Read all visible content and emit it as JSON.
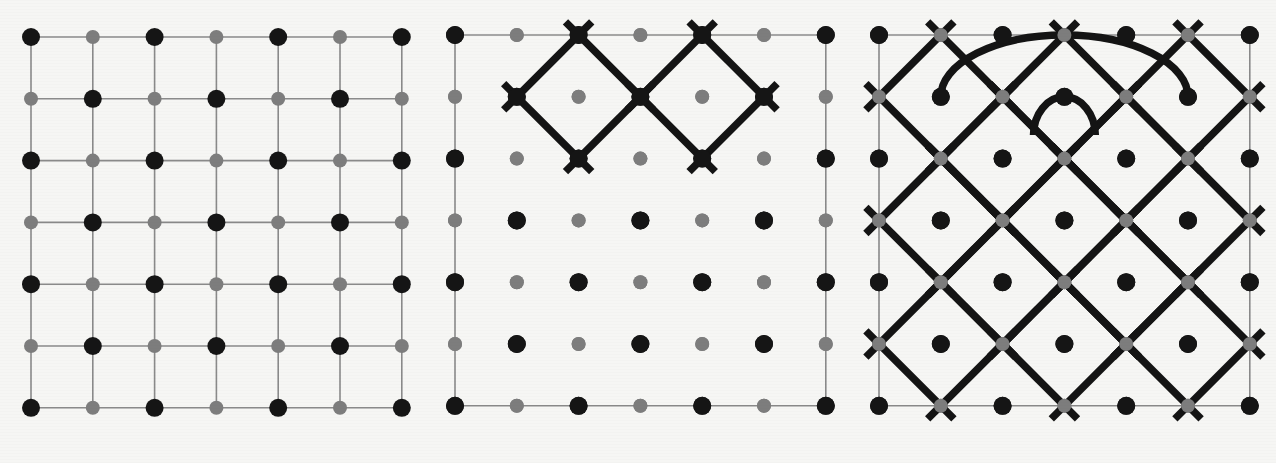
{
  "figure": {
    "background_color": "#f6f6f4",
    "panel_count": 3
  },
  "style": {
    "black_vertex_color": "#151515",
    "gray_vertex_color": "#7d7d7d",
    "thin_edge_color": "#8a8a8a",
    "thick_loop_color": "#141414",
    "black_vertex_radius": 9,
    "gray_vertex_radius": 7,
    "thin_edge_width": 1.6,
    "thick_loop_width": 7.5
  },
  "lattice": {
    "rows": 7,
    "cols": 7,
    "spacing": 61.8,
    "description": "bipartite square lattice, black vertices where (row+col) is even, gray vertices where (row+col) is odd"
  },
  "panels": [
    {
      "id": "panel-a",
      "name": "full-square-grid",
      "label": "",
      "origin_x": 31,
      "origin_y": 37,
      "spacing": 61.8,
      "draw_full_grid": true,
      "draw_boundary_only": false,
      "loops": [],
      "arcs": []
    },
    {
      "id": "panel-b",
      "name": "two-small-loops",
      "label": "",
      "origin_x": 455,
      "origin_y": 35,
      "spacing": 61.8,
      "draw_full_grid": false,
      "draw_boundary_only": true,
      "loops": [
        {
          "name": "loop-left",
          "center_col": 2,
          "center_row": 1,
          "radius_cells": 1
        },
        {
          "name": "loop-right",
          "center_col": 4,
          "center_row": 1,
          "radius_cells": 1
        }
      ],
      "arcs": []
    },
    {
      "id": "panel-c",
      "name": "dense-lattice-with-arcs",
      "label": "",
      "origin_x": 879,
      "origin_y": 35,
      "spacing": 61.8,
      "draw_full_grid": false,
      "draw_boundary_only": true,
      "loops": [
        {
          "name": "loop-r1-c1",
          "center_col": 1,
          "center_row": 1,
          "radius_cells": 1
        },
        {
          "name": "loop-r1-c3",
          "center_col": 3,
          "center_row": 1,
          "radius_cells": 1
        },
        {
          "name": "loop-r1-c5",
          "center_col": 5,
          "center_row": 1,
          "radius_cells": 1
        },
        {
          "name": "loop-r2-c2",
          "center_col": 2,
          "center_row": 2,
          "radius_cells": 1
        },
        {
          "name": "loop-r2-c4",
          "center_col": 4,
          "center_row": 2,
          "radius_cells": 1
        },
        {
          "name": "loop-r3-c1",
          "center_col": 1,
          "center_row": 3,
          "radius_cells": 1
        },
        {
          "name": "loop-r3-c3",
          "center_col": 3,
          "center_row": 3,
          "radius_cells": 1
        },
        {
          "name": "loop-r3-c5",
          "center_col": 5,
          "center_row": 3,
          "radius_cells": 1
        },
        {
          "name": "loop-r4-c2",
          "center_col": 2,
          "center_row": 4,
          "radius_cells": 1
        },
        {
          "name": "loop-r4-c4",
          "center_col": 4,
          "center_row": 4,
          "radius_cells": 1
        },
        {
          "name": "loop-r5-c1",
          "center_col": 1,
          "center_row": 5,
          "radius_cells": 1
        },
        {
          "name": "loop-r5-c3",
          "center_col": 3,
          "center_row": 5,
          "radius_cells": 1
        },
        {
          "name": "loop-r5-c5",
          "center_col": 5,
          "center_row": 5,
          "radius_cells": 1
        }
      ],
      "arcs": [
        {
          "name": "outer-arc",
          "from_col": 1,
          "to_col": 5,
          "row": 0,
          "depth_cells": 1
        },
        {
          "name": "inner-arc",
          "from_col": 2.5,
          "to_col": 3.5,
          "row": 1,
          "depth_cells": 0.62
        }
      ]
    }
  ]
}
